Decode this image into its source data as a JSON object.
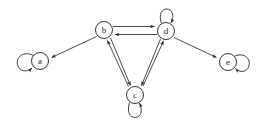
{
  "figure": {
    "type": "directed-graph",
    "width": 261,
    "height": 125,
    "background_color": "#ffffff",
    "stroke_color": "#2b2b2b",
    "node_fill_color": "#ffffff",
    "node_radius": 8.5
  },
  "nodes": [
    {
      "id": "a",
      "label": "a",
      "cx": 40,
      "cy": 61,
      "self_loop": true,
      "loop_side": "left"
    },
    {
      "id": "b",
      "label": "b",
      "cx": 104,
      "cy": 30,
      "self_loop": false,
      "loop_side": ""
    },
    {
      "id": "c",
      "label": "c",
      "cx": 135,
      "cy": 95,
      "self_loop": true,
      "loop_side": "bottom"
    },
    {
      "id": "d",
      "label": "d",
      "cx": 166,
      "cy": 31,
      "self_loop": true,
      "loop_side": "top"
    },
    {
      "id": "e",
      "label": "e",
      "cx": 228,
      "cy": 62,
      "self_loop": true,
      "loop_side": "right"
    }
  ],
  "edges": [
    {
      "from": "b",
      "to": "a",
      "style": "single"
    },
    {
      "from": "b",
      "to": "d",
      "style": "parallel-top"
    },
    {
      "from": "d",
      "to": "b",
      "style": "parallel-bottom"
    },
    {
      "from": "b",
      "to": "c",
      "style": "parallel-right"
    },
    {
      "from": "c",
      "to": "b",
      "style": "parallel-left"
    },
    {
      "from": "d",
      "to": "c",
      "style": "parallel-left"
    },
    {
      "from": "c",
      "to": "d",
      "style": "parallel-right"
    },
    {
      "from": "d",
      "to": "e",
      "style": "single"
    },
    {
      "from": "a",
      "to": "a",
      "style": "self-loop"
    },
    {
      "from": "c",
      "to": "c",
      "style": "self-loop"
    },
    {
      "from": "d",
      "to": "d",
      "style": "self-loop"
    },
    {
      "from": "e",
      "to": "e",
      "style": "self-loop"
    }
  ],
  "background_artifacts": [
    {
      "text": "",
      "x": 8,
      "y": 6
    },
    {
      "text": "",
      "x": 60,
      "y": 6
    },
    {
      "text": "",
      "x": 150,
      "y": 8
    },
    {
      "text": "",
      "x": 200,
      "y": 100
    },
    {
      "text": "",
      "x": 30,
      "y": 112
    }
  ]
}
